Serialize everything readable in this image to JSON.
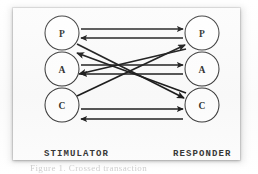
{
  "figure": {
    "kind": "transactional-analysis-ego-state-diagram",
    "caption_partial": "Figure 1. Crossed transaction"
  },
  "columns": {
    "left": {
      "label": "STIMULATOR",
      "nodes": [
        {
          "id": "P",
          "label": "P",
          "name": "Parent"
        },
        {
          "id": "A",
          "label": "A",
          "name": "Adult"
        },
        {
          "id": "C",
          "label": "C",
          "name": "Child"
        }
      ]
    },
    "right": {
      "label": "RESPONDER",
      "nodes": [
        {
          "id": "P",
          "label": "P",
          "name": "Parent"
        },
        {
          "id": "A",
          "label": "A",
          "name": "Adult"
        },
        {
          "id": "C",
          "label": "C",
          "name": "Child"
        }
      ]
    }
  },
  "geometry": {
    "circle_radius": 17,
    "left_center_x": 49,
    "right_center_x": 189,
    "row_centers_y": [
      25,
      61,
      97
    ]
  },
  "arrows": [
    {
      "id": "p-to-p",
      "from": "left.P",
      "to": "right.P",
      "style": "horizontal",
      "direction": "right",
      "offset": -4
    },
    {
      "id": "p-from-p",
      "from": "right.P",
      "to": "left.P",
      "style": "horizontal",
      "direction": "left",
      "offset": 4
    },
    {
      "id": "a-to-a",
      "from": "left.A",
      "to": "right.A",
      "style": "horizontal",
      "direction": "right",
      "offset": -4
    },
    {
      "id": "a-from-a",
      "from": "right.A",
      "to": "left.A",
      "style": "horizontal",
      "direction": "left",
      "offset": 4
    },
    {
      "id": "c-to-c",
      "from": "left.C",
      "to": "right.C",
      "style": "horizontal",
      "direction": "right",
      "offset": -4
    },
    {
      "id": "c-from-c",
      "from": "right.C",
      "to": "left.C",
      "style": "horizontal",
      "direction": "left",
      "offset": 4
    },
    {
      "id": "lp-to-rc",
      "from": "left.P",
      "to": "right.C",
      "style": "diagonal",
      "direction": "down-right"
    },
    {
      "id": "lc-to-rp",
      "from": "left.C",
      "to": "right.P",
      "style": "diagonal",
      "direction": "up-right"
    },
    {
      "id": "rp-to-la",
      "from": "right.P",
      "to": "left.A",
      "style": "diagonal",
      "direction": "down-left"
    },
    {
      "id": "rc-to-la",
      "from": "right.C",
      "to": "left.A",
      "style": "diagonal",
      "direction": "up-left"
    }
  ],
  "colors": {
    "card_background": "#fcfcfc",
    "page_background": "#ffffff",
    "stroke": "#1c1c1c",
    "circle_stroke": "#3a3a3a",
    "label_text": "#2b2b2b",
    "caption_text": "#b9b9b9"
  }
}
